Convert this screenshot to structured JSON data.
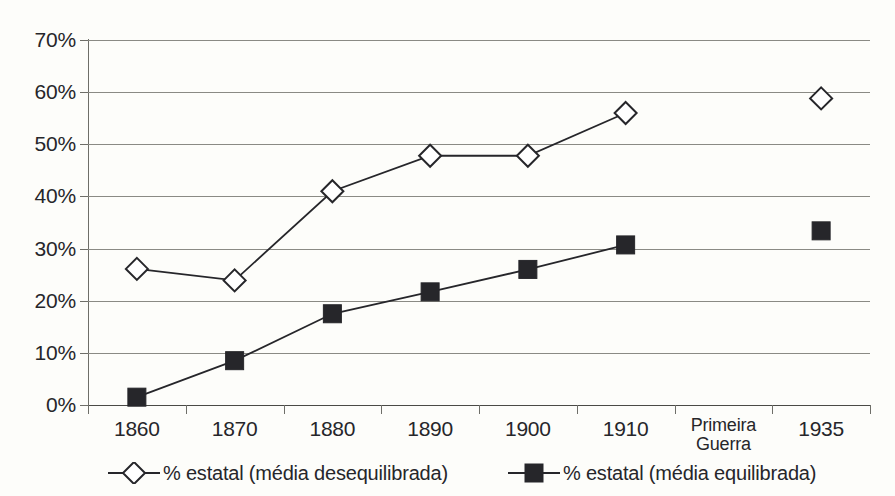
{
  "chart_data": {
    "type": "line",
    "title": "",
    "subtitle": "",
    "xlabel": "",
    "ylabel": "",
    "ylim": [
      0,
      70
    ],
    "ytick_values": [
      70,
      60,
      50,
      40,
      30,
      20,
      10,
      0
    ],
    "ytick_labels": [
      "70%",
      "60%",
      "50%",
      "40%",
      "30%",
      "20%",
      "10%",
      "0%"
    ],
    "grid": true,
    "legend_position": "bottom",
    "categories": [
      "1860",
      "1870",
      "1880",
      "1890",
      "1900",
      "1910",
      "Primeira\nGuerra",
      "1935"
    ],
    "series": [
      {
        "name": "% estatal (média desequilibrada)",
        "marker": "open-diamond",
        "color": "#26262a",
        "values": [
          26.1,
          23.9,
          41.0,
          47.8,
          47.8,
          56.0,
          null,
          58.8
        ],
        "break_after_index": 5
      },
      {
        "name": "% estatal (média equilibrada)",
        "marker": "filled-square",
        "color": "#26262a",
        "values": [
          1.5,
          8.5,
          17.5,
          21.7,
          26.0,
          30.7,
          null,
          33.4
        ],
        "break_after_index": 5
      }
    ]
  },
  "legend": {
    "entries": [
      {
        "label": "% estatal (média desequilibrada)",
        "marker": "open-diamond"
      },
      {
        "label": "% estatal (média equilibrada)",
        "marker": "filled-square"
      }
    ]
  },
  "colors": {
    "background": "#fdfdfa",
    "gridline": "#8a8a84",
    "axis": "#6e6e68",
    "text": "#26262a",
    "series": "#26262a"
  }
}
